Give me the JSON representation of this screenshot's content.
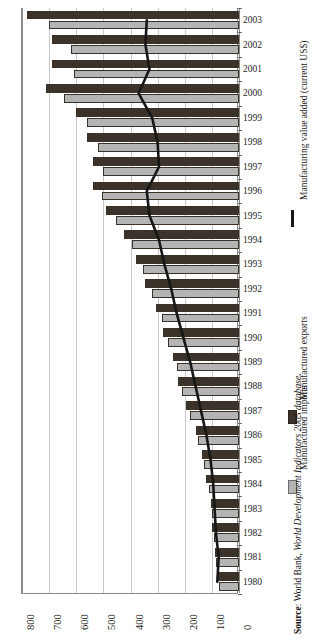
{
  "chart_data": {
    "type": "bar",
    "orientation": "horizontal",
    "title": "",
    "subtitle": "",
    "xlabel": "",
    "ylabel": "",
    "xlim": [
      800,
      0
    ],
    "xlim_note": "axis reversed: 800 at left, 0 at right",
    "xticks": [
      800,
      700,
      600,
      500,
      400,
      300,
      200,
      100,
      0
    ],
    "grid": true,
    "grid_axis": "x",
    "legend_position": "right",
    "categories": [
      "2003",
      "2002",
      "2001",
      "2000",
      "1999",
      "1998",
      "1997",
      "1996",
      "1995",
      "1994",
      "1993",
      "1992",
      "1991",
      "1990",
      "1989",
      "1988",
      "1987",
      "1986",
      "1985",
      "1984",
      "1983",
      "1982",
      "1981",
      "1980"
    ],
    "series": [
      {
        "name": "Manufactured exports",
        "type": "bar",
        "color": "#3b3229",
        "values": [
          780,
          690,
          690,
          710,
          600,
          560,
          540,
          540,
          490,
          425,
          380,
          345,
          305,
          280,
          245,
          225,
          195,
          160,
          135,
          120,
          105,
          100,
          90,
          80
        ]
      },
      {
        "name": "Manufactured imports",
        "type": "bar",
        "color": "#b4b4b4",
        "values": [
          700,
          620,
          610,
          645,
          560,
          520,
          500,
          505,
          455,
          395,
          355,
          320,
          285,
          260,
          230,
          210,
          180,
          150,
          128,
          112,
          100,
          92,
          85,
          75
        ]
      },
      {
        "name": "Manufacturing value added (current US$)",
        "type": "line",
        "color": "#171717",
        "values": [
          340,
          345,
          330,
          370,
          320,
          300,
          295,
          340,
          330,
          295,
          275,
          250,
          230,
          205,
          180,
          160,
          140,
          120,
          105,
          95,
          90,
          85,
          75,
          80
        ]
      }
    ],
    "legend": [
      {
        "label": "Manufacturing value added (current US$)",
        "marker": "line",
        "color": "#171717"
      },
      {
        "label": "Manufactured exports",
        "marker": "swatch",
        "color": "#3b3229"
      },
      {
        "label": "Manufactured imports",
        "marker": "swatch",
        "color": "#b4b4b4"
      }
    ],
    "source": {
      "prefix": "Source",
      "separator": ": ",
      "publisher": "World Bank, ",
      "database": "World Development Indicators 2005 database",
      "suffix": "."
    }
  }
}
